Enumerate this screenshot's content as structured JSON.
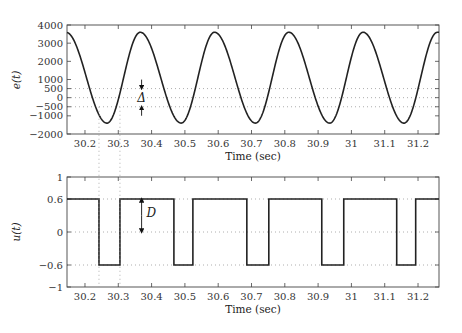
{
  "chart_data": [
    {
      "type": "line",
      "id": "error-signal",
      "title": "",
      "xlabel": "Time (sec)",
      "ylabel": "e(t)",
      "xlim": [
        30.146,
        31.263
      ],
      "ylim": [
        -2000,
        4000
      ],
      "xticks": [
        30.2,
        30.3,
        30.4,
        30.5,
        30.6,
        30.7,
        30.8,
        30.9,
        31,
        31.1,
        31.2
      ],
      "xtick_labels": [
        "30.2",
        "30.3",
        "30.4",
        "30.5",
        "30.6",
        "30.7",
        "30.8",
        "30.9",
        "31",
        "31.1",
        "31.2"
      ],
      "yticks": [
        -2000,
        -1000,
        -500,
        0,
        500,
        1000,
        2000,
        3000,
        4000
      ],
      "ytick_labels": [
        "−2000",
        "−1000",
        "−500",
        "0",
        "500",
        "1000",
        "2000",
        "3000",
        "4000"
      ],
      "reference_lines": [
        500,
        0,
        -500
      ],
      "waveform": {
        "description": "periodic oscillation, slow fall then faster rise",
        "max": 3600,
        "min": -1400,
        "period": 0.2235,
        "minima_times": [
          30.266,
          30.489,
          30.712,
          30.935,
          31.158
        ],
        "maxima_times": [
          30.366,
          30.589,
          30.812,
          31.035,
          31.258
        ]
      },
      "annotation": {
        "label": "Δ",
        "x": 30.37,
        "from": 500,
        "to": -500
      }
    },
    {
      "type": "line",
      "id": "relay-output",
      "title": "",
      "xlabel": "Time (sec)",
      "ylabel": "u(t)",
      "xlim": [
        30.146,
        31.263
      ],
      "ylim": [
        -1,
        1
      ],
      "xticks": [
        30.2,
        30.3,
        30.4,
        30.5,
        30.6,
        30.7,
        30.8,
        30.9,
        31,
        31.1,
        31.2
      ],
      "xtick_labels": [
        "30.2",
        "30.3",
        "30.4",
        "30.5",
        "30.6",
        "30.7",
        "30.8",
        "30.9",
        "31",
        "31.1",
        "31.2"
      ],
      "yticks": [
        -1,
        -0.6,
        0,
        0.6,
        1
      ],
      "ytick_labels": [
        "−1",
        "−0.6",
        "0",
        "0.6",
        "1"
      ],
      "reference_lines": [
        0.6,
        0,
        -0.6
      ],
      "high": 0.6,
      "low": -0.6,
      "low_intervals": [
        [
          30.242,
          30.305
        ],
        [
          30.467,
          30.524
        ],
        [
          30.686,
          30.752
        ],
        [
          30.911,
          30.977
        ],
        [
          31.136,
          31.193
        ]
      ],
      "annotation": {
        "label": "D",
        "x": 30.37,
        "from": 0.6,
        "to": 0
      }
    }
  ],
  "connector_lines_x": [
    30.242,
    30.305
  ]
}
